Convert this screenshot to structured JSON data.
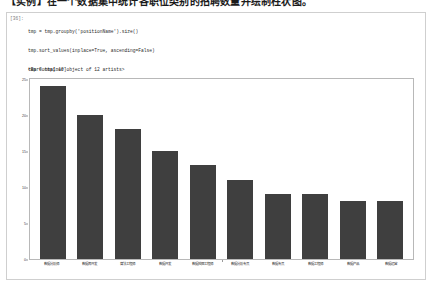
{
  "heading": "【实例】在一个数据集中统计各职位类别的招聘数量并绘制柱状图。",
  "cell": {
    "prompt": "[36]:",
    "code": [
      "tmp = tmp.groupby('positionName').size()",
      "tmp.sort_values(inplace=True, ascending=False)",
      "tmp = tmp[:10]",
      "x = tmp.index",
      "y = tmp.values",
      "plt.figure(figsize=(20, 8))",
      "plt.bar(x, y)"
    ],
    "output_text": "<BarContainer object of 12 artists>"
  },
  "chart_data": {
    "type": "bar",
    "title": "",
    "xlabel": "",
    "ylabel": "",
    "ylim": [
      0,
      25
    ],
    "yticks": [
      0,
      5,
      10,
      15,
      20,
      25
    ],
    "grid": false,
    "legend": null,
    "bar_color": "#3f3f3f",
    "categories": [
      "数据分析师",
      "数据库开发",
      "算法工程师",
      "数据开发",
      "数据挖掘工程师",
      "数据分析专员",
      "数据专员",
      "数据工程师",
      "数据产品",
      "数据运营"
    ],
    "values": [
      24,
      20,
      18,
      15,
      13,
      11,
      9,
      9,
      8,
      8
    ]
  },
  "colors": {
    "bar": "#3f3f3f",
    "frame": "#b8b8b8",
    "cell_border": "#cfcfcf",
    "code_text": "#2b2b2b",
    "prompt_text": "#7a7a7a"
  }
}
